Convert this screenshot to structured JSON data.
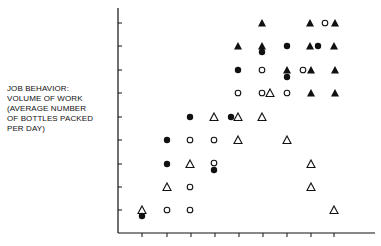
{
  "chart_data": {
    "type": "scatter",
    "title": "",
    "xlabel": "",
    "ylabel": "JOB BEHAVIOR: VOLUME OF WORK (AVERAGE NUMBER OF BOTTLES PACKED PER DAY)",
    "ylabel_lines": [
      "JOB BEHAVIOR:",
      "VOLUME OF WORK",
      "(AVERAGE NUMBER",
      " OF BOTTLES PACKED",
      " PER DAY)"
    ],
    "x_ticks": 9,
    "y_ticks": 9,
    "tick_labels_x": [],
    "tick_labels_y": [],
    "grid": false,
    "legend": null,
    "marker_types": {
      "filled_circle": "●",
      "open_circle": "○",
      "filled_triangle": "▲",
      "open_triangle": "△"
    },
    "points": [
      {
        "x": 142,
        "y": 210,
        "m": "open_triangle"
      },
      {
        "x": 142,
        "y": 216,
        "m": "filled_circle"
      },
      {
        "x": 167,
        "y": 210,
        "m": "open_circle"
      },
      {
        "x": 190,
        "y": 210,
        "m": "open_circle"
      },
      {
        "x": 334,
        "y": 210,
        "m": "open_triangle"
      },
      {
        "x": 167,
        "y": 187,
        "m": "open_triangle"
      },
      {
        "x": 190,
        "y": 187,
        "m": "open_circle"
      },
      {
        "x": 311,
        "y": 187,
        "m": "open_triangle"
      },
      {
        "x": 167,
        "y": 164,
        "m": "filled_circle"
      },
      {
        "x": 190,
        "y": 164,
        "m": "open_triangle"
      },
      {
        "x": 214,
        "y": 163,
        "m": "open_circle"
      },
      {
        "x": 214,
        "y": 170,
        "m": "filled_circle"
      },
      {
        "x": 311,
        "y": 164,
        "m": "open_triangle"
      },
      {
        "x": 167,
        "y": 140,
        "m": "filled_circle"
      },
      {
        "x": 190,
        "y": 140,
        "m": "open_circle"
      },
      {
        "x": 214,
        "y": 140,
        "m": "open_circle"
      },
      {
        "x": 238,
        "y": 140,
        "m": "open_triangle"
      },
      {
        "x": 287,
        "y": 140,
        "m": "open_triangle"
      },
      {
        "x": 190,
        "y": 117,
        "m": "filled_circle"
      },
      {
        "x": 214,
        "y": 117,
        "m": "open_triangle"
      },
      {
        "x": 231,
        "y": 117,
        "m": "filled_circle"
      },
      {
        "x": 238,
        "y": 117,
        "m": "open_triangle"
      },
      {
        "x": 262,
        "y": 117,
        "m": "open_triangle"
      },
      {
        "x": 238,
        "y": 93,
        "m": "open_circle"
      },
      {
        "x": 262,
        "y": 93,
        "m": "open_circle"
      },
      {
        "x": 270,
        "y": 93,
        "m": "open_triangle"
      },
      {
        "x": 287,
        "y": 93,
        "m": "open_circle"
      },
      {
        "x": 311,
        "y": 93,
        "m": "filled_triangle"
      },
      {
        "x": 335,
        "y": 93,
        "m": "filled_triangle"
      },
      {
        "x": 238,
        "y": 70,
        "m": "filled_circle"
      },
      {
        "x": 262,
        "y": 70,
        "m": "open_circle"
      },
      {
        "x": 287,
        "y": 70,
        "m": "filled_triangle"
      },
      {
        "x": 287,
        "y": 77,
        "m": "filled_circle"
      },
      {
        "x": 303,
        "y": 70,
        "m": "open_circle"
      },
      {
        "x": 311,
        "y": 70,
        "m": "filled_triangle"
      },
      {
        "x": 335,
        "y": 70,
        "m": "filled_triangle"
      },
      {
        "x": 238,
        "y": 46,
        "m": "filled_triangle"
      },
      {
        "x": 262,
        "y": 46,
        "m": "filled_triangle"
      },
      {
        "x": 262,
        "y": 52,
        "m": "filled_circle"
      },
      {
        "x": 287,
        "y": 46,
        "m": "filled_circle"
      },
      {
        "x": 310,
        "y": 46,
        "m": "filled_triangle"
      },
      {
        "x": 318,
        "y": 46,
        "m": "filled_circle"
      },
      {
        "x": 334,
        "y": 46,
        "m": "filled_triangle"
      },
      {
        "x": 262,
        "y": 23,
        "m": "filled_triangle"
      },
      {
        "x": 310,
        "y": 23,
        "m": "filled_triangle"
      },
      {
        "x": 325,
        "y": 23,
        "m": "open_circle"
      },
      {
        "x": 335,
        "y": 23,
        "m": "filled_triangle"
      }
    ],
    "axes": {
      "origin": [
        118,
        233
      ],
      "x_end": 375,
      "y_top": 8,
      "x_tick_positions": [
        142,
        167,
        191,
        215,
        239,
        263,
        287,
        311,
        334
      ],
      "y_tick_positions": [
        210,
        187,
        164,
        140,
        117,
        93,
        70,
        46,
        23
      ]
    },
    "colors": {
      "ink": "#111111",
      "background": "#ffffff"
    }
  }
}
